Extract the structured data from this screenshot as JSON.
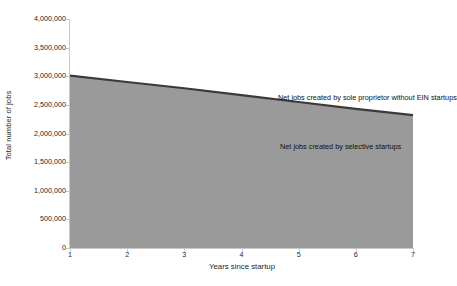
{
  "chart_data": {
    "type": "area",
    "title": "",
    "subtitle": "",
    "xlabel": "Years since startup",
    "ylabel": "Total number of jobs",
    "x": [
      1,
      2,
      3,
      4,
      5,
      6,
      7
    ],
    "xlim": [
      1,
      7
    ],
    "ylim": [
      0,
      4000000
    ],
    "xticks": [
      "1",
      "2",
      "3",
      "4",
      "5",
      "6",
      "7"
    ],
    "yticks": [
      "0",
      "500,000",
      "1,000,000",
      "1,500,000",
      "2,000,000",
      "2,500,000",
      "3,000,000",
      "3,500,000",
      "4,000,000"
    ],
    "ytick_values": [
      0,
      500000,
      1000000,
      1500000,
      2000000,
      2500000,
      3000000,
      3500000,
      4000000
    ],
    "grid": false,
    "legend_position": "inline-annotations",
    "series": [
      {
        "name": "Net jobs created by selective startups",
        "type": "area",
        "fill_color": "#9a9a9a",
        "line_color": "#3a3a3a",
        "values": [
          3010000,
          2900000,
          2790000,
          2670000,
          2550000,
          2430000,
          2320000
        ]
      }
    ],
    "annotations": [
      {
        "name": "sole-proprietor-label",
        "text": "Net jobs created by sole proprietor without EIN startups",
        "x": 3.65,
        "y": 3050000
      },
      {
        "name": "selective-startups-label",
        "text": "Net jobs created by selective startups",
        "x": 3.7,
        "y": 2180000
      }
    ],
    "colors": {
      "area_fill": "#9a9a9a",
      "area_line": "#3a3a3a",
      "axis": "#c9c9c9",
      "plot_background": "#ffffff",
      "text": "#1f1f1f"
    }
  }
}
